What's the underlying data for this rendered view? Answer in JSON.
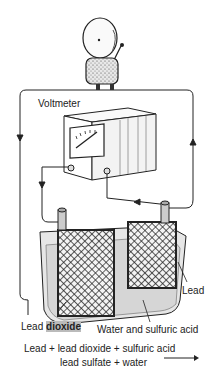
{
  "labels": {
    "voltmeter": "Voltmeter",
    "lead": "Lead",
    "lead_dioxide_prefix": "Lead",
    "lead_dioxide_word": "dioxide",
    "electrolyte": "Water and sulfuric acid",
    "equation_line1": "Lead + lead dioxide + sulfuric acid",
    "equation_line2": "lead sulfate + water"
  },
  "components": [
    "electric-bell",
    "voltmeter",
    "battery-cell",
    "lead-plate",
    "lead-dioxide-plate",
    "connecting-wires"
  ],
  "colors": {
    "ink": "#222222",
    "electrolyte": "#dcdcdc",
    "box_side": "#eeeeee",
    "background": "#ffffff"
  }
}
